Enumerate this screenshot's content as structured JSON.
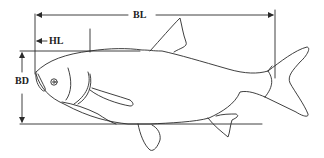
{
  "diagram": {
    "labels": {
      "bl": "BL",
      "hl": "HL",
      "bd": "BD"
    },
    "colors": {
      "stroke": "#2a2a2a",
      "background": "#ffffff"
    }
  }
}
